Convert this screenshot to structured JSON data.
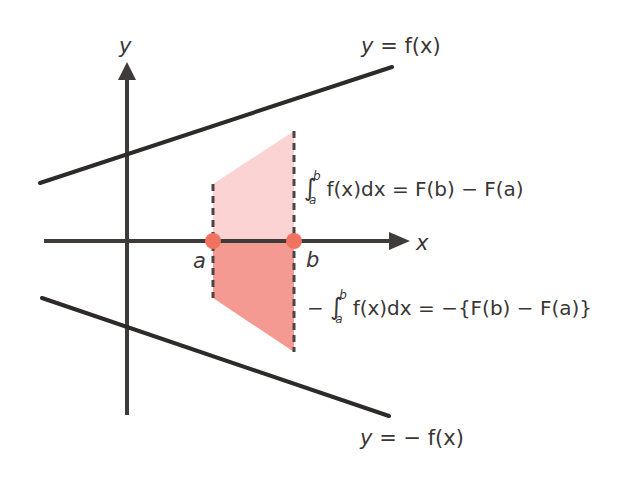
{
  "diagram": {
    "axes": {
      "x_label": "x",
      "y_label": "y",
      "origin_px": [
        127,
        241
      ]
    },
    "curves": [
      {
        "name": "f",
        "label": "y = f(x)",
        "label_parts": {
          "lhs": "y",
          "eq": "=",
          "rhs": "f(x)"
        },
        "from_px": [
          40,
          183
        ],
        "to_px": [
          392,
          67
        ]
      },
      {
        "name": "neg_f",
        "label": "y = −f(x)",
        "label_parts": {
          "lhs": "y",
          "eq": "=",
          "rhs": "− f(x)"
        },
        "from_px": [
          42,
          298
        ],
        "to_px": [
          389,
          416
        ]
      }
    ],
    "points": [
      {
        "name": "a",
        "label": "a",
        "px": [
          213,
          241
        ]
      },
      {
        "name": "b",
        "label": "b",
        "px": [
          294,
          241
        ]
      }
    ],
    "regions": [
      {
        "name": "upper",
        "color": "#fbd3d3",
        "polygon_px": [
          [
            213,
            184
          ],
          [
            294,
            131
          ],
          [
            294,
            241
          ],
          [
            213,
            241
          ]
        ]
      },
      {
        "name": "lower",
        "color": "#f59a92",
        "polygon_px": [
          [
            213,
            241
          ],
          [
            294,
            241
          ],
          [
            294,
            352
          ],
          [
            213,
            298
          ]
        ]
      }
    ],
    "equations": {
      "upper": {
        "int_upper": "b",
        "int_lower": "a",
        "integrand": "f(x)dx",
        "rhs": "= F(b) − F(a)",
        "full": "∫_a^b f(x)dx = F(b) − F(a)"
      },
      "lower": {
        "prefix": "−",
        "int_upper": "b",
        "int_lower": "a",
        "integrand": "f(x)dx",
        "rhs": "= −{F(b) − F(a)}",
        "full": "− ∫_a^b f(x)dx = −{F(b) − F(a)}"
      }
    },
    "colors": {
      "line": "#2e2a2a",
      "axis": "#3f3b3b",
      "dashed": "#4a4545",
      "point": "#f0735f",
      "upper_region": "#fbd3d3",
      "lower_region": "#f59a92",
      "text": "#3a3636"
    }
  }
}
